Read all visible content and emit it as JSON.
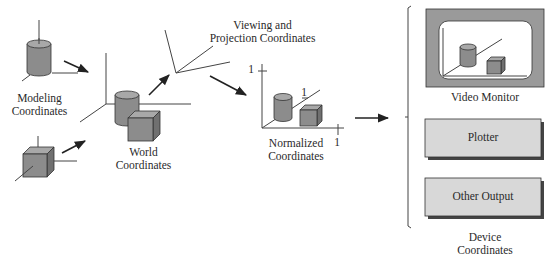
{
  "stages": {
    "modeling": {
      "label_line1": "Modeling",
      "label_line2": "Coordinates"
    },
    "world": {
      "label_line1": "World",
      "label_line2": "Coordinates"
    },
    "viewing": {
      "label_line1": "Viewing and",
      "label_line2": "Projection Coordinates"
    },
    "normalized": {
      "label_line1": "Normalized",
      "label_line2": "Coordinates",
      "axis_tick_y": "1",
      "axis_tick_z": "1",
      "axis_tick_x": "1"
    },
    "device": {
      "label_line1": "Device",
      "label_line2": "Coordinates",
      "outputs": [
        {
          "label": "Video Monitor"
        },
        {
          "label": "Plotter"
        },
        {
          "label": "Other Output"
        }
      ]
    }
  },
  "colors": {
    "object_fill": "#8c8c8c",
    "object_top": "#a8a8a8",
    "object_side": "#707070",
    "monitor_frame": "#9a9a9a",
    "device_box_fill": "#d8d8d8",
    "line": "#333333"
  }
}
